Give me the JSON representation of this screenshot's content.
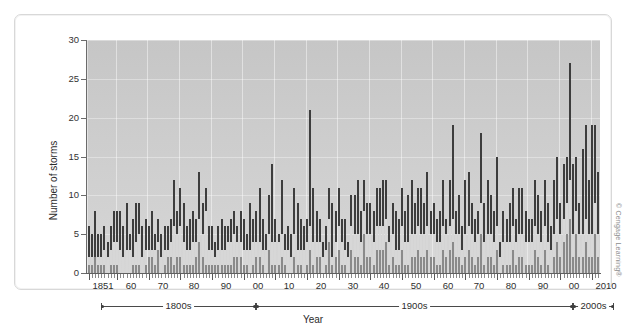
{
  "credit": "© Cengage Learning®",
  "chart_data": {
    "type": "bar",
    "title": "",
    "xlabel": "Year",
    "ylabel": "Number of storms",
    "ylim": [
      0,
      30
    ],
    "yticks": [
      0,
      5,
      10,
      15,
      20,
      25,
      30
    ],
    "grid": "vertical and horizontal light gridlines on gray panel",
    "legend_position": "none",
    "stacked": true,
    "x_start_year": 1851,
    "x_end_year": 2012,
    "xtick_labels": [
      "1851",
      "60",
      "70",
      "80",
      "90",
      "00",
      "10",
      "20",
      "30",
      "40",
      "50",
      "60",
      "70",
      "80",
      "90",
      "00",
      "2010"
    ],
    "xtick_years": [
      1851,
      1860,
      1870,
      1880,
      1890,
      1900,
      1910,
      1920,
      1930,
      1940,
      1950,
      1960,
      1970,
      1980,
      1990,
      2000,
      2010
    ],
    "century_brackets": [
      {
        "label": "1800s",
        "from": 1851,
        "to": 1899
      },
      {
        "label": "1900s",
        "from": 1900,
        "to": 1999
      },
      {
        "label": "2000s",
        "from": 2000,
        "to": 2012
      }
    ],
    "series": [
      {
        "name": "Major hurricanes",
        "color": "#8a8a8a",
        "values": [
          1,
          1,
          2,
          1,
          1,
          1,
          0,
          1,
          1,
          1,
          0,
          0,
          0,
          0,
          1,
          1,
          1,
          0,
          1,
          2,
          2,
          1,
          3,
          0,
          1,
          2,
          2,
          1,
          2,
          2,
          1,
          1,
          1,
          1,
          2,
          4,
          2,
          1,
          1,
          1,
          1,
          1,
          1,
          1,
          1,
          1,
          2,
          2,
          2,
          1,
          1,
          0,
          1,
          2,
          2,
          1,
          0,
          3,
          1,
          1,
          1,
          2,
          1,
          0,
          0,
          2,
          1,
          1,
          0,
          1,
          3,
          1,
          2,
          2,
          0,
          1,
          4,
          1,
          2,
          3,
          1,
          1,
          0,
          3,
          2,
          2,
          1,
          5,
          2,
          2,
          1,
          3,
          3,
          3,
          4,
          1,
          2,
          1,
          1,
          3,
          1,
          1,
          2,
          2,
          3,
          2,
          2,
          3,
          2,
          2,
          1,
          1,
          3,
          2,
          3,
          4,
          2,
          2,
          1,
          2,
          3,
          2,
          1,
          2,
          5,
          1,
          2,
          2,
          1,
          3,
          0,
          1,
          1,
          1,
          3,
          1,
          2,
          2,
          1,
          1,
          1,
          3,
          2,
          1,
          3,
          1,
          0,
          2,
          4,
          2,
          4,
          5,
          7,
          2,
          5,
          2,
          2,
          4,
          2,
          2,
          5,
          2
        ]
      },
      {
        "name": "Hurricanes",
        "color": "#d7d7d7",
        "values": [
          2,
          2,
          2,
          2,
          2,
          3,
          2,
          3,
          4,
          4,
          3,
          2,
          3,
          3,
          2,
          4,
          5,
          2,
          3,
          3,
          3,
          3,
          4,
          2,
          3,
          3,
          4,
          6,
          5,
          6,
          4,
          3,
          3,
          4,
          4,
          7,
          5,
          8,
          3,
          3,
          2,
          3,
          3,
          3,
          4,
          4,
          5,
          4,
          4,
          3,
          3,
          3,
          4,
          4,
          4,
          3,
          3,
          5,
          4,
          4,
          4,
          5,
          3,
          3,
          2,
          5,
          3,
          3,
          3,
          4,
          6,
          4,
          4,
          4,
          2,
          3,
          7,
          2,
          4,
          6,
          4,
          3,
          2,
          6,
          5,
          5,
          4,
          8,
          5,
          5,
          4,
          6,
          6,
          6,
          7,
          4,
          5,
          3,
          3,
          6,
          4,
          4,
          5,
          5,
          6,
          5,
          5,
          6,
          5,
          5,
          4,
          4,
          6,
          5,
          6,
          7,
          5,
          5,
          3,
          5,
          6,
          5,
          4,
          5,
          9,
          4,
          5,
          5,
          4,
          6,
          2,
          4,
          4,
          4,
          6,
          4,
          5,
          5,
          4,
          4,
          4,
          6,
          5,
          4,
          6,
          4,
          3,
          5,
          7,
          5,
          7,
          9,
          12,
          5,
          8,
          5,
          5,
          7,
          5,
          5,
          9,
          5
        ]
      },
      {
        "name": "Named storms (total)",
        "color": "#3d3d3d",
        "values": [
          6,
          5,
          8,
          5,
          5,
          6,
          4,
          6,
          8,
          8,
          8,
          6,
          9,
          5,
          7,
          9,
          9,
          6,
          7,
          6,
          8,
          5,
          7,
          5,
          6,
          6,
          7,
          12,
          8,
          11,
          9,
          6,
          7,
          8,
          7,
          13,
          9,
          11,
          6,
          6,
          4,
          6,
          7,
          6,
          6,
          7,
          8,
          6,
          8,
          7,
          5,
          9,
          7,
          8,
          11,
          7,
          5,
          10,
          14,
          7,
          5,
          12,
          5,
          6,
          5,
          11,
          9,
          7,
          6,
          7,
          21,
          11,
          8,
          7,
          4,
          6,
          11,
          9,
          8,
          11,
          7,
          7,
          4,
          10,
          10,
          12,
          8,
          12,
          9,
          9,
          8,
          11,
          11,
          12,
          12,
          6,
          9,
          8,
          7,
          11,
          8,
          10,
          12,
          9,
          11,
          11,
          9,
          13,
          8,
          9,
          7,
          8,
          12,
          7,
          12,
          19,
          8,
          10,
          6,
          12,
          13,
          9,
          7,
          8,
          18,
          9,
          12,
          10,
          8,
          15,
          4,
          8,
          7,
          9,
          11,
          7,
          11,
          11,
          8,
          7,
          7,
          12,
          10,
          8,
          12,
          9,
          6,
          12,
          15,
          9,
          14,
          15,
          27,
          14,
          15,
          9,
          16,
          19,
          12,
          19,
          19,
          13
        ]
      }
    ]
  }
}
